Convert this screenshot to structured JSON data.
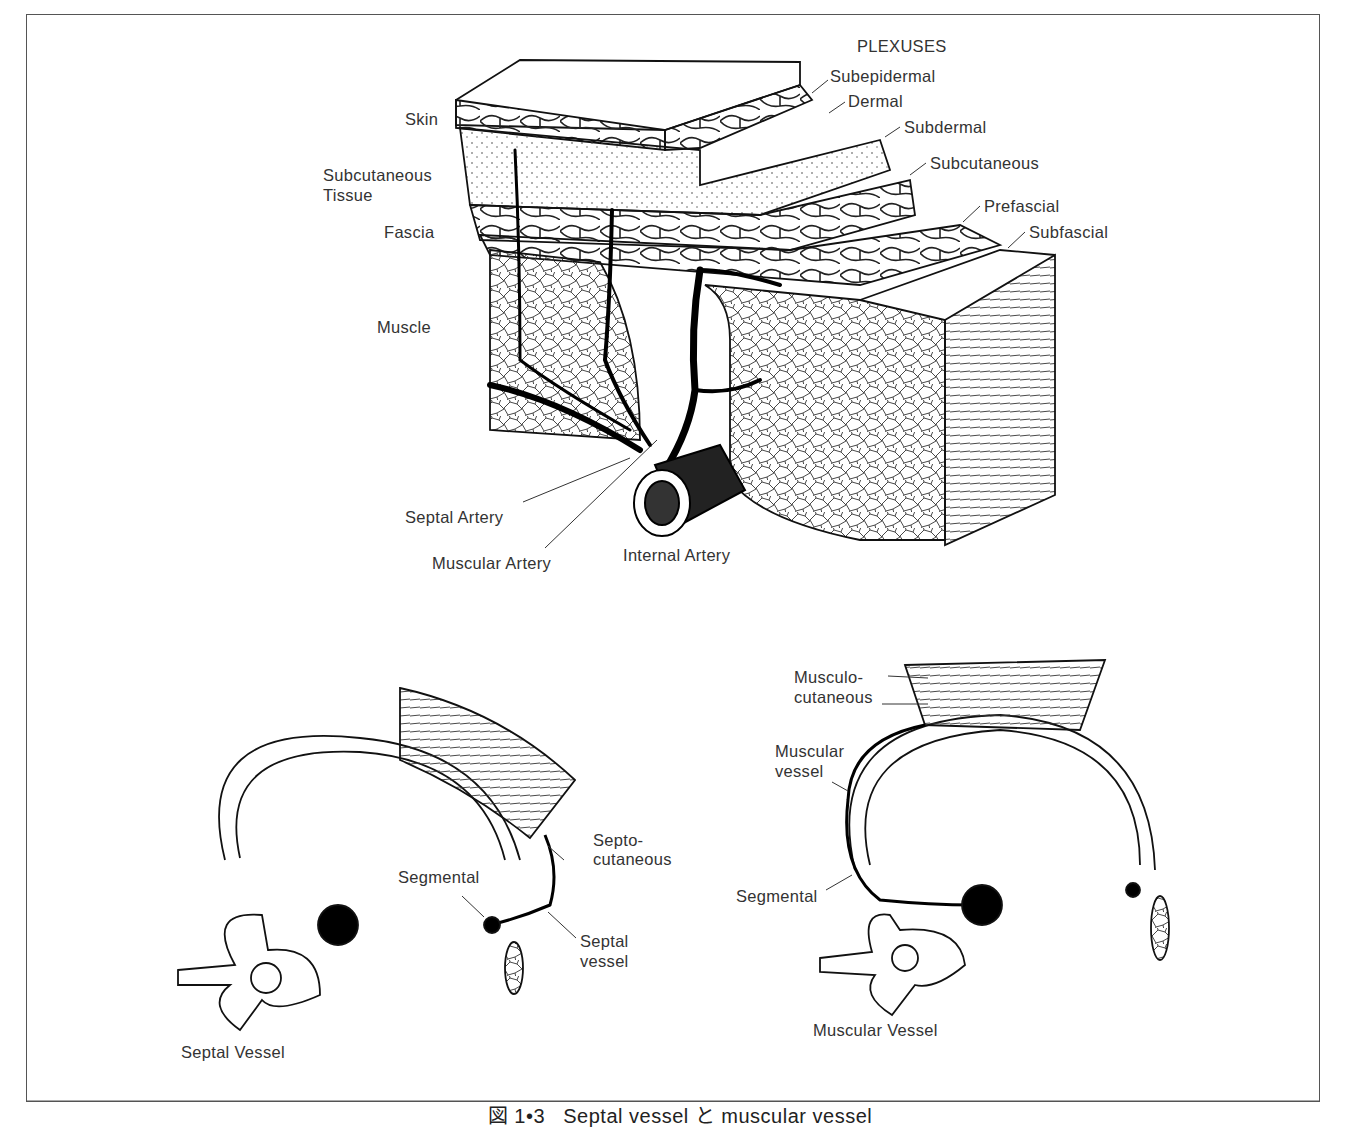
{
  "figure": {
    "caption_prefix": "図 1•3",
    "caption_text": "Septal vessel と muscular vessel"
  },
  "top_diagram": {
    "plexuses_header": "PLEXUSES",
    "plexuses": [
      "Subepidermal",
      "Dermal",
      "Subdermal",
      "Subcutaneous",
      "Prefascial",
      "Subfascial"
    ],
    "layers": {
      "skin": "Skin",
      "subcutaneous_line1": "Subcutaneous",
      "subcutaneous_line2": "Tissue",
      "fascia": "Fascia",
      "muscle": "Muscle"
    },
    "arteries": {
      "septal": "Septal  Artery",
      "muscular": "Muscular  Artery",
      "internal": "Internal  Artery"
    }
  },
  "bottom_left_diagram": {
    "septo_line1": "Septo-",
    "septo_line2": "cutaneous",
    "segmental": "Segmental",
    "septal_vessel_line1": "Septal",
    "septal_vessel_line2": "vessel",
    "title": "Septal  Vessel"
  },
  "bottom_right_diagram": {
    "musculo_line1": "Musculo-",
    "musculo_line2": "cutaneous",
    "muscular_vessel_line1": "Muscular",
    "muscular_vessel_line2": "vessel",
    "segmental": "Segmental",
    "title": "Muscular  Vessel"
  }
}
